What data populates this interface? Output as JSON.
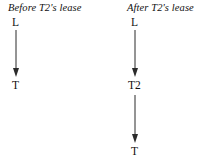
{
  "figure": {
    "background_color": "#ffffff",
    "stroke_color": "#2b2b2b",
    "text_color": "#111111"
  },
  "panels": [
    {
      "id": "before",
      "title": "Before T2's lease",
      "nodes": [
        {
          "id": "before-l",
          "label": "L"
        },
        {
          "id": "before-t",
          "label": "T"
        }
      ],
      "edges": [
        {
          "id": "before-edge-l-to-t",
          "from": "L",
          "to": "T",
          "style": "arrow-down"
        }
      ]
    },
    {
      "id": "after",
      "title": "After T2's lease",
      "nodes": [
        {
          "id": "after-l",
          "label": "L"
        },
        {
          "id": "after-t2",
          "label": "T2"
        },
        {
          "id": "after-t",
          "label": "T"
        }
      ],
      "edges": [
        {
          "id": "after-edge-l-to-t2",
          "from": "L",
          "to": "T2",
          "style": "arrow-down"
        },
        {
          "id": "after-edge-t2-to-t",
          "from": "T2",
          "to": "T",
          "style": "arrow-down"
        }
      ]
    }
  ]
}
